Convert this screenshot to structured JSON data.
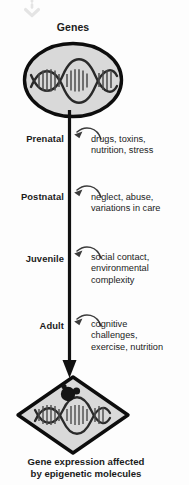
{
  "diagram": {
    "top_label": "Genes",
    "caption_lines": [
      "Gene expression affected",
      "by epigenetic molecules"
    ],
    "colors": {
      "background": "#fdfdfd",
      "axis": "#111111",
      "node_fill": "#d9d9d9",
      "node_stroke": "#0d0d0d",
      "text": "#1b1b1b",
      "faint_arrow": "#e2e2e2",
      "molecule": "#151515"
    },
    "top_arrow": {
      "icon": "dotted-down-arrow-icon",
      "style": "dotted",
      "direction": "down"
    },
    "genes_node": {
      "shape": "ellipse",
      "icon": "dna-helix-icon"
    },
    "outcome_node": {
      "shape": "diamond",
      "icon": "dna-helix-with-molecule-icon",
      "molecule_icon": "epigenetic-molecule-icon"
    },
    "stages": [
      {
        "label": "Prenatal",
        "arrow_icon": "curved-left-arrow-icon",
        "factors": [
          "drugs, toxins,",
          "nutrition, stress"
        ]
      },
      {
        "label": "Postnatal",
        "arrow_icon": "curved-left-arrow-icon",
        "factors": [
          "neglect, abuse,",
          "variations in care"
        ]
      },
      {
        "label": "Juvenile",
        "arrow_icon": "curved-left-arrow-icon",
        "factors": [
          "social contact,",
          "environmental",
          "complexity"
        ]
      },
      {
        "label": "Adult",
        "arrow_icon": "curved-left-arrow-icon",
        "factors": [
          "cognitive",
          "challenges,",
          "exercise, nutrition"
        ]
      }
    ]
  }
}
